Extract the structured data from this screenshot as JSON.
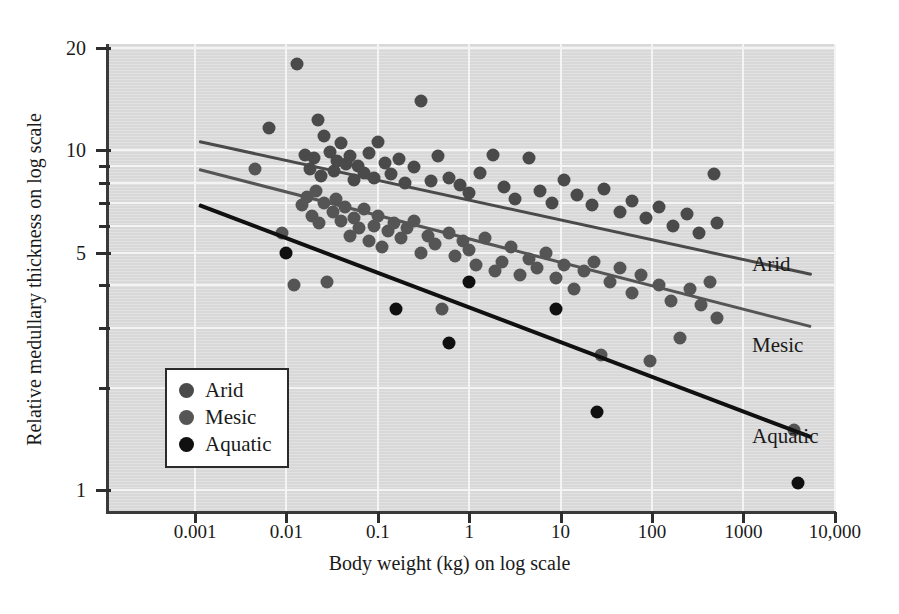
{
  "chart_data": {
    "type": "scatter",
    "title": "",
    "xlabel": "Body weight (kg) on log scale",
    "ylabel": "Relative medullary thickness on log scale",
    "xscale": "log",
    "yscale": "log",
    "xlim": [
      0.00023,
      10000
    ],
    "ylim": [
      0.88,
      20
    ],
    "grid": true,
    "legend_position": "lower-left",
    "xticks": [
      "0.001",
      "0.01",
      "0.1",
      "1",
      "10",
      "100",
      "1000",
      "10,000"
    ],
    "xtick_values": [
      0.001,
      0.01,
      0.1,
      1,
      10,
      100,
      1000,
      10000
    ],
    "yticks": [
      "20",
      "10",
      "5",
      "1"
    ],
    "ytick_values": [
      20,
      10,
      5,
      1
    ],
    "yminor_values": [
      9,
      8,
      7,
      6,
      4,
      3,
      2
    ],
    "series": [
      {
        "name": "Arid",
        "color": "#4a4a4a",
        "points": [
          [
            0.0065,
            11.6
          ],
          [
            0.013,
            18.0
          ],
          [
            0.016,
            9.7
          ],
          [
            0.018,
            8.8
          ],
          [
            0.02,
            9.5
          ],
          [
            0.022,
            12.3
          ],
          [
            0.024,
            8.4
          ],
          [
            0.026,
            11.0
          ],
          [
            0.03,
            9.9
          ],
          [
            0.033,
            8.7
          ],
          [
            0.036,
            9.3
          ],
          [
            0.04,
            10.5
          ],
          [
            0.045,
            9.1
          ],
          [
            0.05,
            9.6
          ],
          [
            0.055,
            8.2
          ],
          [
            0.06,
            9.0
          ],
          [
            0.07,
            8.6
          ],
          [
            0.08,
            9.8
          ],
          [
            0.09,
            8.3
          ],
          [
            0.1,
            10.6
          ],
          [
            0.12,
            9.2
          ],
          [
            0.14,
            8.5
          ],
          [
            0.17,
            9.4
          ],
          [
            0.2,
            8.0
          ],
          [
            0.25,
            8.9
          ],
          [
            0.3,
            14.0
          ],
          [
            0.38,
            8.1
          ],
          [
            0.45,
            9.6
          ],
          [
            0.6,
            8.3
          ],
          [
            0.8,
            7.9
          ],
          [
            1.0,
            7.5
          ],
          [
            1.3,
            8.6
          ],
          [
            1.8,
            9.7
          ],
          [
            2.4,
            7.8
          ],
          [
            3.2,
            7.2
          ],
          [
            4.5,
            9.5
          ],
          [
            6.0,
            7.6
          ],
          [
            8.0,
            7.0
          ],
          [
            11,
            8.2
          ],
          [
            15,
            7.4
          ],
          [
            22,
            6.9
          ],
          [
            30,
            7.7
          ],
          [
            45,
            6.6
          ],
          [
            60,
            7.1
          ],
          [
            85,
            6.3
          ],
          [
            120,
            6.8
          ],
          [
            170,
            6.0
          ],
          [
            240,
            6.5
          ],
          [
            330,
            5.7
          ],
          [
            480,
            8.5
          ],
          [
            520,
            6.1
          ]
        ]
      },
      {
        "name": "Mesic",
        "color": "#555555",
        "points": [
          [
            0.0045,
            8.8
          ],
          [
            0.009,
            5.7
          ],
          [
            0.012,
            4.0
          ],
          [
            0.015,
            6.9
          ],
          [
            0.017,
            7.3
          ],
          [
            0.019,
            6.4
          ],
          [
            0.021,
            7.6
          ],
          [
            0.023,
            6.1
          ],
          [
            0.026,
            7.0
          ],
          [
            0.028,
            4.1
          ],
          [
            0.032,
            6.6
          ],
          [
            0.035,
            7.2
          ],
          [
            0.04,
            6.2
          ],
          [
            0.044,
            6.8
          ],
          [
            0.05,
            5.6
          ],
          [
            0.055,
            6.3
          ],
          [
            0.062,
            5.9
          ],
          [
            0.07,
            6.7
          ],
          [
            0.08,
            5.4
          ],
          [
            0.09,
            6.0
          ],
          [
            0.1,
            6.4
          ],
          [
            0.11,
            5.2
          ],
          [
            0.13,
            5.8
          ],
          [
            0.15,
            6.1
          ],
          [
            0.18,
            5.5
          ],
          [
            0.21,
            5.9
          ],
          [
            0.25,
            6.2
          ],
          [
            0.3,
            5.0
          ],
          [
            0.35,
            5.6
          ],
          [
            0.42,
            5.3
          ],
          [
            0.5,
            3.4
          ],
          [
            0.6,
            5.7
          ],
          [
            0.7,
            4.9
          ],
          [
            0.85,
            5.4
          ],
          [
            1.0,
            5.1
          ],
          [
            1.2,
            4.6
          ],
          [
            1.5,
            5.5
          ],
          [
            1.9,
            4.4
          ],
          [
            2.3,
            4.7
          ],
          [
            2.9,
            5.2
          ],
          [
            3.6,
            4.3
          ],
          [
            4.5,
            4.8
          ],
          [
            5.5,
            4.5
          ],
          [
            7.0,
            5.0
          ],
          [
            9.0,
            4.2
          ],
          [
            11,
            4.6
          ],
          [
            14,
            3.9
          ],
          [
            18,
            4.4
          ],
          [
            23,
            4.7
          ],
          [
            28,
            2.5
          ],
          [
            35,
            4.1
          ],
          [
            45,
            4.5
          ],
          [
            60,
            3.8
          ],
          [
            75,
            4.3
          ],
          [
            95,
            2.4
          ],
          [
            120,
            4.0
          ],
          [
            160,
            3.6
          ],
          [
            200,
            2.8
          ],
          [
            260,
            3.9
          ],
          [
            340,
            3.5
          ],
          [
            430,
            4.1
          ],
          [
            520,
            3.2
          ],
          [
            3600,
            1.5
          ]
        ]
      },
      {
        "name": "Aquatic",
        "color": "#101010",
        "points": [
          [
            0.01,
            5.0
          ],
          [
            0.16,
            3.4
          ],
          [
            0.6,
            2.7
          ],
          [
            1.0,
            4.1
          ],
          [
            9.0,
            3.4
          ],
          [
            25,
            1.7
          ],
          [
            4000,
            1.05
          ]
        ]
      }
    ],
    "trendlines": [
      {
        "name": "Arid",
        "color": "#4a4a4a",
        "x0": 0.0011,
        "y0": 10.7,
        "x1": 5500,
        "y1": 4.35,
        "label": "Arid"
      },
      {
        "name": "Mesic",
        "color": "#555555",
        "x0": 0.0011,
        "y0": 8.85,
        "x1": 5500,
        "y1": 3.05,
        "label": "Mesic"
      },
      {
        "name": "Aquatic",
        "color": "#101010",
        "x0": 0.0011,
        "y0": 7.0,
        "x1": 5500,
        "y1": 1.45,
        "label": "Aquatic"
      }
    ],
    "legend": {
      "items": [
        {
          "label": "Arid",
          "color": "#4a4a4a"
        },
        {
          "label": "Mesic",
          "color": "#555555"
        },
        {
          "label": "Aquatic",
          "color": "#101010"
        }
      ]
    }
  }
}
